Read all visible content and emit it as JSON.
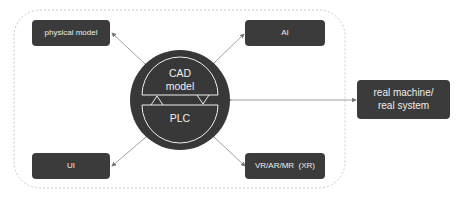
{
  "diagram": {
    "center": {
      "top_label": "CAD\nmodel",
      "top_line1": "CAD",
      "top_line2": "model",
      "bottom_label": "PLC"
    },
    "nodes": [
      {
        "id": "physical_model",
        "label": "physical model"
      },
      {
        "id": "ai",
        "label": "AI"
      },
      {
        "id": "ui",
        "label": "UI"
      },
      {
        "id": "xr",
        "label": "VR/AR/MR  (XR)"
      },
      {
        "id": "real",
        "line1": "real machine/",
        "line2": "real system"
      }
    ],
    "colors": {
      "box": "#3b3b3b",
      "circle": "#3b3b3b",
      "text": "#eeeeee",
      "arrow": "#888888",
      "dashed_border": "#cccccc"
    }
  }
}
